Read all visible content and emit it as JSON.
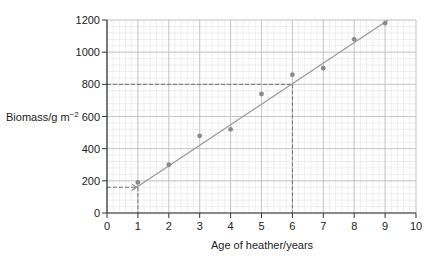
{
  "chart_data": {
    "type": "scatter",
    "title": "",
    "xlabel": "Age of heather/years",
    "ylabel": "Biomass/g m⁻²",
    "ylabel_main": "Biomass/g m",
    "ylabel_sup": "−2",
    "xlim": [
      0,
      10
    ],
    "ylim": [
      0,
      1200
    ],
    "x_ticks": [
      0,
      1,
      2,
      3,
      4,
      5,
      6,
      7,
      8,
      9,
      10
    ],
    "y_ticks": [
      0,
      200,
      400,
      600,
      800,
      1000,
      1200
    ],
    "grid": true,
    "legend": null,
    "series": [
      {
        "name": "Biomass",
        "x": [
          1,
          2,
          3,
          4,
          5,
          6,
          7,
          8,
          9
        ],
        "values": [
          190,
          300,
          480,
          520,
          740,
          860,
          900,
          1080,
          1180
        ]
      }
    ],
    "best_fit_line": {
      "x": [
        0.8,
        9.1
      ],
      "y": [
        140,
        1200
      ]
    },
    "annotations": [
      {
        "type": "dashed-arrow",
        "from": [
          0,
          160
        ],
        "to": [
          1,
          160
        ],
        "note": "horizontal dashed arrow to line at age 1"
      },
      {
        "type": "dashed",
        "from": [
          1,
          160
        ],
        "to": [
          1,
          0
        ]
      },
      {
        "type": "dashed",
        "from": [
          0,
          800
        ],
        "to": [
          6,
          800
        ]
      },
      {
        "type": "dashed",
        "from": [
          6,
          800
        ],
        "to": [
          6,
          0
        ]
      }
    ],
    "colors": {
      "points": "#8a8a8a",
      "line": "#9a9a9a",
      "grid_major": "#bdbdbd",
      "grid_minor": "#e4e4e4",
      "axis": "#333333"
    }
  }
}
